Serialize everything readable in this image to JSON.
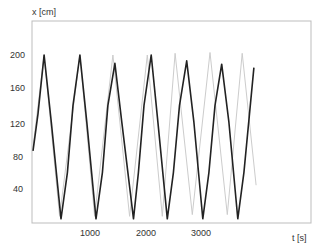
{
  "chart_data": {
    "type": "line",
    "title": "",
    "xlabel": "t [s]",
    "ylabel": "x [cm]",
    "xlim": [
      0,
      5000
    ],
    "ylim": [
      0,
      200
    ],
    "x_ticks": [
      1000,
      2000,
      3000
    ],
    "y_ticks": [
      40,
      80,
      120,
      160,
      200
    ],
    "grid": false,
    "legend": null,
    "series": [
      {
        "name": "measured (dark)",
        "color": "#222222",
        "points": [
          [
            0,
            86
          ],
          [
            90,
            130
          ],
          [
            200,
            200
          ],
          [
            330,
            120
          ],
          [
            505,
            5
          ],
          [
            620,
            60
          ],
          [
            720,
            140
          ],
          [
            845,
            200
          ],
          [
            970,
            120
          ],
          [
            1135,
            5
          ],
          [
            1250,
            60
          ],
          [
            1350,
            140
          ],
          [
            1475,
            190
          ],
          [
            1600,
            120
          ],
          [
            1810,
            5
          ],
          [
            1900,
            60
          ],
          [
            2000,
            140
          ],
          [
            2130,
            200
          ],
          [
            2250,
            120
          ],
          [
            2420,
            5
          ],
          [
            2530,
            60
          ],
          [
            2640,
            140
          ],
          [
            2770,
            193
          ],
          [
            2900,
            120
          ],
          [
            3060,
            5
          ],
          [
            3170,
            60
          ],
          [
            3280,
            140
          ],
          [
            3400,
            189
          ],
          [
            3530,
            120
          ],
          [
            3690,
            5
          ],
          [
            3800,
            60
          ],
          [
            3980,
            185
          ]
        ]
      },
      {
        "name": "model (light)",
        "color": "#cccccc",
        "points": [
          [
            0,
            90
          ],
          [
            200,
            200
          ],
          [
            480,
            8
          ],
          [
            845,
            200
          ],
          [
            1110,
            8
          ],
          [
            1440,
            200
          ],
          [
            1740,
            8
          ],
          [
            2060,
            200
          ],
          [
            2330,
            8
          ],
          [
            2560,
            202
          ],
          [
            2870,
            10
          ],
          [
            3190,
            203
          ],
          [
            3500,
            10
          ],
          [
            3770,
            202
          ],
          [
            4020,
            45
          ]
        ]
      }
    ]
  },
  "axes": {
    "y_label": "x [cm]",
    "x_label": "t [s]",
    "y_tick_labels": [
      "200",
      "160",
      "120",
      "80",
      "40"
    ],
    "x_tick_labels": [
      "1000",
      "2000",
      "3000"
    ]
  }
}
